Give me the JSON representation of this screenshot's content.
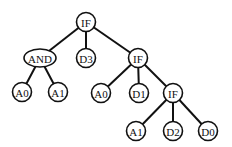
{
  "diagram": {
    "type": "tree",
    "nodes": [
      {
        "id": "n0",
        "label": "IF",
        "x": 86,
        "y": 22,
        "shape": "circle"
      },
      {
        "id": "n1",
        "label": "AND",
        "x": 40,
        "y": 58,
        "shape": "ellipse"
      },
      {
        "id": "n2",
        "label": "D3",
        "x": 86,
        "y": 58,
        "shape": "circle"
      },
      {
        "id": "n3",
        "label": "IF",
        "x": 138,
        "y": 58,
        "shape": "circle"
      },
      {
        "id": "n4",
        "label": "A0",
        "x": 22,
        "y": 92,
        "shape": "circle"
      },
      {
        "id": "n5",
        "label": "A1",
        "x": 58,
        "y": 92,
        "shape": "circle"
      },
      {
        "id": "n6",
        "label": "A0",
        "x": 101,
        "y": 93,
        "shape": "circle"
      },
      {
        "id": "n7",
        "label": "D1",
        "x": 139,
        "y": 93,
        "shape": "circle"
      },
      {
        "id": "n8",
        "label": "IF",
        "x": 173,
        "y": 93,
        "shape": "circle"
      },
      {
        "id": "n9",
        "label": "A1",
        "x": 136,
        "y": 131,
        "shape": "circle"
      },
      {
        "id": "n10",
        "label": "D2",
        "x": 173,
        "y": 131,
        "shape": "circle"
      },
      {
        "id": "n11",
        "label": "D0",
        "x": 208,
        "y": 131,
        "shape": "circle"
      }
    ],
    "edges": [
      [
        "n0",
        "n1"
      ],
      [
        "n0",
        "n2"
      ],
      [
        "n0",
        "n3"
      ],
      [
        "n1",
        "n4"
      ],
      [
        "n1",
        "n5"
      ],
      [
        "n3",
        "n6"
      ],
      [
        "n3",
        "n7"
      ],
      [
        "n3",
        "n8"
      ],
      [
        "n8",
        "n9"
      ],
      [
        "n8",
        "n10"
      ],
      [
        "n8",
        "n11"
      ]
    ]
  }
}
